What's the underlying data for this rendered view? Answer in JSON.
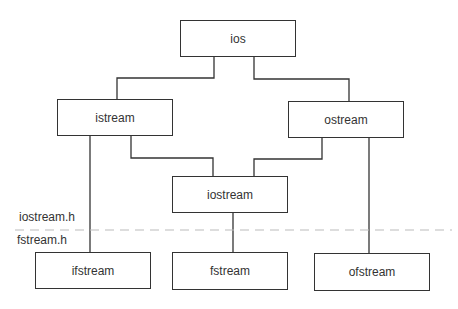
{
  "diagram": {
    "type": "class-hierarchy",
    "nodes": [
      {
        "id": "ios",
        "label": "ios",
        "x": 180,
        "y": 20,
        "w": 116,
        "h": 37
      },
      {
        "id": "istream",
        "label": "istream",
        "x": 57,
        "y": 99,
        "w": 116,
        "h": 37
      },
      {
        "id": "ostream",
        "label": "ostream",
        "x": 288,
        "y": 101,
        "w": 116,
        "h": 37
      },
      {
        "id": "iostream",
        "label": "iostream",
        "x": 172,
        "y": 176,
        "w": 116,
        "h": 37
      },
      {
        "id": "ifstream",
        "label": "ifstream",
        "x": 35,
        "y": 252,
        "w": 116,
        "h": 37
      },
      {
        "id": "fstream",
        "label": "fstream",
        "x": 172,
        "y": 252,
        "w": 116,
        "h": 38
      },
      {
        "id": "ofstream",
        "label": "ofstream",
        "x": 314,
        "y": 253,
        "w": 116,
        "h": 38
      }
    ],
    "edges": [
      {
        "from": "ios",
        "to": "istream"
      },
      {
        "from": "ios",
        "to": "ostream"
      },
      {
        "from": "istream",
        "to": "iostream"
      },
      {
        "from": "ostream",
        "to": "iostream"
      },
      {
        "from": "istream",
        "to": "ifstream"
      },
      {
        "from": "iostream",
        "to": "fstream"
      },
      {
        "from": "ostream",
        "to": "ofstream"
      }
    ],
    "separator": {
      "upper_label": "iostream.h",
      "lower_label": "fstream.h"
    }
  }
}
